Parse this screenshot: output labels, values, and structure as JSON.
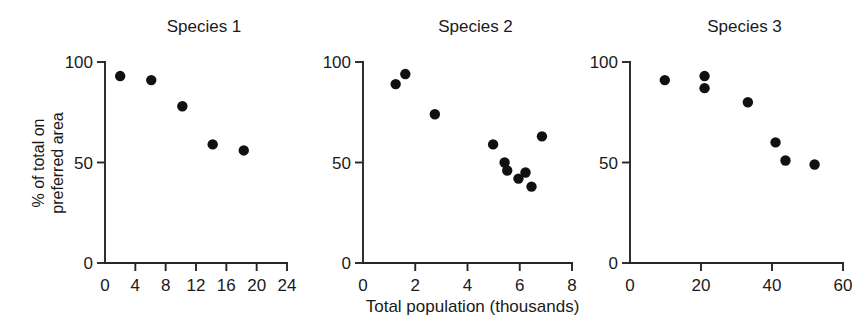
{
  "figure": {
    "x_axis_caption": "Total population (thousands)",
    "y_axis_caption_line1": "% of total on",
    "y_axis_caption_line2": "preferred area",
    "marker_color": "#111111",
    "axis_color": "#262626"
  },
  "chart_data": [
    {
      "type": "scatter",
      "title": "Species 1",
      "xlabel": "Total population (thousands)",
      "ylabel": "% of total on preferred area",
      "xlim": [
        0,
        24
      ],
      "ylim": [
        0,
        100
      ],
      "xticks": [
        0,
        4,
        8,
        12,
        16,
        20,
        24
      ],
      "yticks": [
        0,
        50,
        100
      ],
      "xtick_labels": [
        "0",
        "4",
        "8",
        "12",
        "16",
        "20",
        "24"
      ],
      "ytick_labels": [
        "0",
        "50",
        "100"
      ],
      "grid": false,
      "legend": "none",
      "points": [
        {
          "x": 2.0,
          "y": 93
        },
        {
          "x": 6.1,
          "y": 91
        },
        {
          "x": 10.2,
          "y": 78
        },
        {
          "x": 14.2,
          "y": 59
        },
        {
          "x": 18.3,
          "y": 56
        }
      ]
    },
    {
      "type": "scatter",
      "title": "Species 2",
      "xlabel": "Total population (thousands)",
      "ylabel": "% of total on preferred area",
      "xlim": [
        0,
        8
      ],
      "ylim": [
        0,
        100
      ],
      "xticks": [
        0,
        2,
        4,
        6,
        8
      ],
      "yticks": [
        0,
        50,
        100
      ],
      "xtick_labels": [
        "0",
        "2",
        "4",
        "6",
        "8"
      ],
      "ytick_labels": [
        "0",
        "50",
        "100"
      ],
      "grid": false,
      "legend": "none",
      "points": [
        {
          "x": 1.25,
          "y": 89
        },
        {
          "x": 1.62,
          "y": 94
        },
        {
          "x": 2.75,
          "y": 74
        },
        {
          "x": 4.98,
          "y": 59
        },
        {
          "x": 5.42,
          "y": 50
        },
        {
          "x": 5.52,
          "y": 46
        },
        {
          "x": 5.95,
          "y": 42
        },
        {
          "x": 6.22,
          "y": 45
        },
        {
          "x": 6.45,
          "y": 38
        },
        {
          "x": 6.85,
          "y": 63
        }
      ]
    },
    {
      "type": "scatter",
      "title": "Species 3",
      "xlabel": "Total population (thousands)",
      "ylabel": "% of total on preferred area",
      "xlim": [
        0,
        60
      ],
      "ylim": [
        0,
        100
      ],
      "xticks": [
        0,
        20,
        40,
        60
      ],
      "yticks": [
        0,
        50,
        100
      ],
      "xtick_labels": [
        "0",
        "20",
        "40",
        "60"
      ],
      "ytick_labels": [
        "0",
        "50",
        "100"
      ],
      "grid": false,
      "legend": "none",
      "points": [
        {
          "x": 9.8,
          "y": 91
        },
        {
          "x": 21.0,
          "y": 93
        },
        {
          "x": 21.0,
          "y": 87
        },
        {
          "x": 33.2,
          "y": 80
        },
        {
          "x": 41.0,
          "y": 60
        },
        {
          "x": 43.8,
          "y": 51
        },
        {
          "x": 52.0,
          "y": 49
        }
      ]
    }
  ]
}
